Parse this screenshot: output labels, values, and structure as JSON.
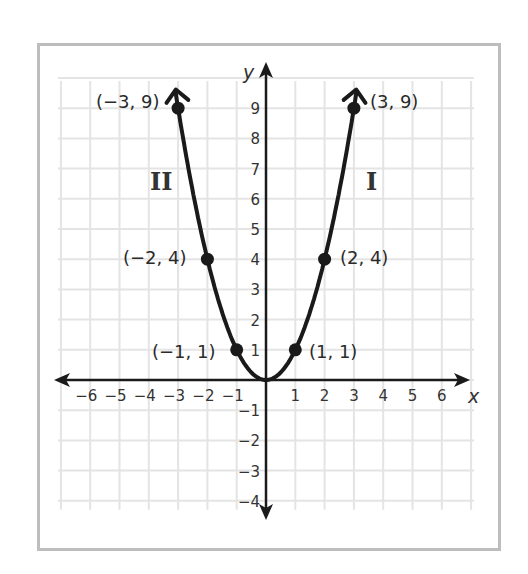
{
  "chart_data": {
    "type": "line",
    "title": "",
    "function": "y = x^2",
    "xlabel": "x",
    "ylabel": "y",
    "xlim": [
      -6,
      6
    ],
    "ylim": [
      -4,
      9
    ],
    "grid": true,
    "x_ticks": [
      "−6",
      "−5",
      "−4",
      "−3",
      "−2",
      "−1",
      "1",
      "2",
      "3",
      "4",
      "5",
      "6"
    ],
    "y_ticks": [
      "9",
      "8",
      "7",
      "6",
      "5",
      "4",
      "3",
      "2",
      "1",
      "−1",
      "−2",
      "−3",
      "−4"
    ],
    "series": [
      {
        "name": "y = x^2",
        "x": [
          -3,
          -2,
          -1,
          0,
          1,
          2,
          3
        ],
        "y": [
          9,
          4,
          1,
          0,
          1,
          4,
          9
        ]
      }
    ],
    "points": [
      {
        "x": -3,
        "y": 9,
        "label": "(−3, 9)"
      },
      {
        "x": -2,
        "y": 4,
        "label": "(−2, 4)"
      },
      {
        "x": -1,
        "y": 1,
        "label": "(−1, 1)"
      },
      {
        "x": 1,
        "y": 1,
        "label": "(1, 1)"
      },
      {
        "x": 2,
        "y": 4,
        "label": "(2, 4)"
      },
      {
        "x": 3,
        "y": 9,
        "label": "(3, 9)"
      }
    ],
    "annotations": [
      {
        "text": "II",
        "position": "left branch"
      },
      {
        "text": "I",
        "position": "right branch"
      }
    ]
  },
  "labels": {
    "x_axis": "x",
    "y_axis": "y",
    "quadrant_left": "II",
    "quadrant_right": "I",
    "p_m3": "(−3, 9)",
    "p_m2": "(−2, 4)",
    "p_m1": "(−1, 1)",
    "p_1": "(1, 1)",
    "p_2": "(2, 4)",
    "p_3": "(3, 9)"
  }
}
